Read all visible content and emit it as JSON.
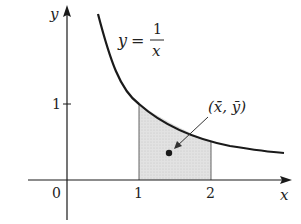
{
  "figure": {
    "function_label": {
      "lhs": "y",
      "eq": "=",
      "numerator": "1",
      "denominator": "x"
    },
    "axes": {
      "x_label": "x",
      "y_label": "y",
      "origin": "0"
    },
    "x_ticks": [
      "1",
      "2"
    ],
    "y_ticks": [
      "1"
    ],
    "centroid_label": "(x̄, ȳ)",
    "shaded_region": {
      "from": 1,
      "to": 2,
      "color": "#d8d8d8"
    },
    "colors": {
      "ink": "#1a1a1a",
      "shade": "#d8d8d8"
    }
  }
}
